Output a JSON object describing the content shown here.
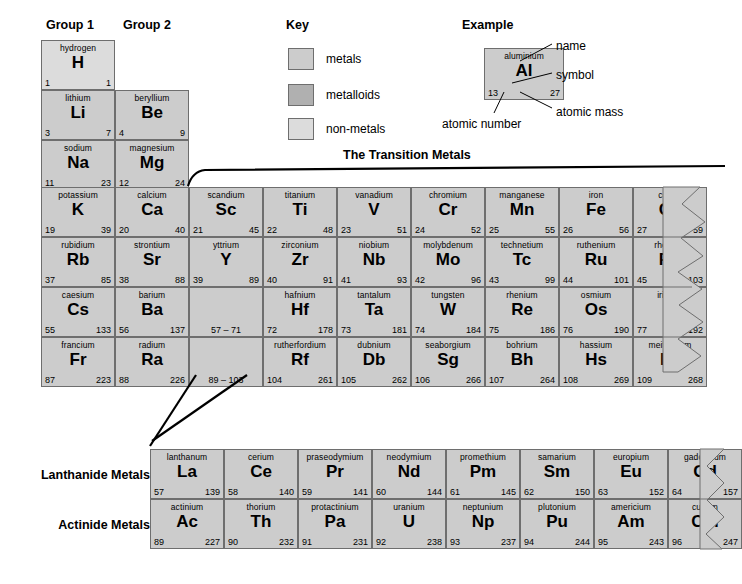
{
  "headers": {
    "group1": "Group 1",
    "group2": "Group 2",
    "key_title": "Key",
    "example_title": "Example",
    "transition_title": "The Transition Metals",
    "lanthanide_label": "Lanthanide Metals",
    "actinide_label": "Actinide Metals"
  },
  "key": {
    "items": [
      {
        "label": "metals",
        "class": "sw-metals",
        "color": "#cccccc"
      },
      {
        "label": "metalloids",
        "class": "sw-metalloids",
        "color": "#b0b0b0"
      },
      {
        "label": "non-metals",
        "class": "sw-nonmetals",
        "color": "#dcdcdc"
      }
    ]
  },
  "example": {
    "name": "aluminium",
    "symbol": "Al",
    "number": "13",
    "mass": "27",
    "callouts": {
      "name": "name",
      "symbol": "symbol",
      "atomic_mass": "atomic mass",
      "atomic_number": "atomic number"
    }
  },
  "main_table": {
    "rows": [
      [
        {
          "name": "hydrogen",
          "symbol": "H",
          "number": "1",
          "mass": "1",
          "type": "nonmetal"
        }
      ],
      [
        {
          "name": "lithium",
          "symbol": "Li",
          "number": "3",
          "mass": "7",
          "type": "metal"
        },
        {
          "name": "beryllium",
          "symbol": "Be",
          "number": "4",
          "mass": "9",
          "type": "metal"
        }
      ],
      [
        {
          "name": "sodium",
          "symbol": "Na",
          "number": "11",
          "mass": "23",
          "type": "metal"
        },
        {
          "name": "magnesium",
          "symbol": "Mg",
          "number": "12",
          "mass": "24",
          "type": "metal"
        }
      ],
      [
        {
          "name": "potassium",
          "symbol": "K",
          "number": "19",
          "mass": "39",
          "type": "metal"
        },
        {
          "name": "calcium",
          "symbol": "Ca",
          "number": "20",
          "mass": "40",
          "type": "metal"
        },
        {
          "name": "scandium",
          "symbol": "Sc",
          "number": "21",
          "mass": "45",
          "type": "metal"
        },
        {
          "name": "titanium",
          "symbol": "Ti",
          "number": "22",
          "mass": "48",
          "type": "metal"
        },
        {
          "name": "vanadium",
          "symbol": "V",
          "number": "23",
          "mass": "51",
          "type": "metal"
        },
        {
          "name": "chromium",
          "symbol": "Cr",
          "number": "24",
          "mass": "52",
          "type": "metal"
        },
        {
          "name": "manganese",
          "symbol": "Mn",
          "number": "25",
          "mass": "55",
          "type": "metal"
        },
        {
          "name": "iron",
          "symbol": "Fe",
          "number": "26",
          "mass": "56",
          "type": "metal"
        },
        {
          "name": "cobalt",
          "symbol": "Co",
          "number": "27",
          "mass": "59",
          "type": "metal"
        }
      ],
      [
        {
          "name": "rubidium",
          "symbol": "Rb",
          "number": "37",
          "mass": "85",
          "type": "metal"
        },
        {
          "name": "strontium",
          "symbol": "Sr",
          "number": "38",
          "mass": "88",
          "type": "metal"
        },
        {
          "name": "yttrium",
          "symbol": "Y",
          "number": "39",
          "mass": "89",
          "type": "metal"
        },
        {
          "name": "zirconium",
          "symbol": "Zr",
          "number": "40",
          "mass": "91",
          "type": "metal"
        },
        {
          "name": "niobium",
          "symbol": "Nb",
          "number": "41",
          "mass": "93",
          "type": "metal"
        },
        {
          "name": "molybdenum",
          "symbol": "Mo",
          "number": "42",
          "mass": "96",
          "type": "metal"
        },
        {
          "name": "technetium",
          "symbol": "Tc",
          "number": "43",
          "mass": "99",
          "type": "metal"
        },
        {
          "name": "ruthenium",
          "symbol": "Ru",
          "number": "44",
          "mass": "101",
          "type": "metal"
        },
        {
          "name": "rhodium",
          "symbol": "Rh",
          "number": "45",
          "mass": "103",
          "type": "metal"
        }
      ],
      [
        {
          "name": "caesium",
          "symbol": "Cs",
          "number": "55",
          "mass": "133",
          "type": "metal"
        },
        {
          "name": "barium",
          "symbol": "Ba",
          "number": "56",
          "mass": "137",
          "type": "metal"
        },
        {
          "range": "57 – 71",
          "type": "metal"
        },
        {
          "name": "hafnium",
          "symbol": "Hf",
          "number": "72",
          "mass": "178",
          "type": "metal"
        },
        {
          "name": "tantalum",
          "symbol": "Ta",
          "number": "73",
          "mass": "181",
          "type": "metal"
        },
        {
          "name": "tungsten",
          "symbol": "W",
          "number": "74",
          "mass": "184",
          "type": "metal"
        },
        {
          "name": "rhenium",
          "symbol": "Re",
          "number": "75",
          "mass": "186",
          "type": "metal"
        },
        {
          "name": "osmium",
          "symbol": "Os",
          "number": "76",
          "mass": "190",
          "type": "metal"
        },
        {
          "name": "iridium",
          "symbol": "Ir",
          "number": "77",
          "mass": "192",
          "type": "metal"
        }
      ],
      [
        {
          "name": "francium",
          "symbol": "Fr",
          "number": "87",
          "mass": "223",
          "type": "metal"
        },
        {
          "name": "radium",
          "symbol": "Ra",
          "number": "88",
          "mass": "226",
          "type": "metal"
        },
        {
          "range": "89 – 103",
          "type": "metal"
        },
        {
          "name": "rutherfordium",
          "symbol": "Rf",
          "number": "104",
          "mass": "261",
          "type": "metal"
        },
        {
          "name": "dubnium",
          "symbol": "Db",
          "number": "105",
          "mass": "262",
          "type": "metal"
        },
        {
          "name": "seaborgium",
          "symbol": "Sg",
          "number": "106",
          "mass": "266",
          "type": "metal"
        },
        {
          "name": "bohrium",
          "symbol": "Bh",
          "number": "107",
          "mass": "264",
          "type": "metal"
        },
        {
          "name": "hassium",
          "symbol": "Hs",
          "number": "108",
          "mass": "269",
          "type": "metal"
        },
        {
          "name": "meitnerium",
          "symbol": "Mt",
          "number": "109",
          "mass": "268",
          "type": "metal"
        }
      ]
    ]
  },
  "lanthanides": [
    {
      "name": "lanthanum",
      "symbol": "La",
      "number": "57",
      "mass": "139",
      "type": "metal"
    },
    {
      "name": "cerium",
      "symbol": "Ce",
      "number": "58",
      "mass": "140",
      "type": "metal"
    },
    {
      "name": "praseodymium",
      "symbol": "Pr",
      "number": "59",
      "mass": "141",
      "type": "metal"
    },
    {
      "name": "neodymium",
      "symbol": "Nd",
      "number": "60",
      "mass": "144",
      "type": "metal"
    },
    {
      "name": "promethium",
      "symbol": "Pm",
      "number": "61",
      "mass": "145",
      "type": "metal"
    },
    {
      "name": "samarium",
      "symbol": "Sm",
      "number": "62",
      "mass": "150",
      "type": "metal"
    },
    {
      "name": "europium",
      "symbol": "Eu",
      "number": "63",
      "mass": "152",
      "type": "metal"
    },
    {
      "name": "gadolinium",
      "symbol": "Gd",
      "number": "64",
      "mass": "157",
      "type": "metal"
    }
  ],
  "actinides": [
    {
      "name": "actinium",
      "symbol": "Ac",
      "number": "89",
      "mass": "227",
      "type": "metal"
    },
    {
      "name": "thorium",
      "symbol": "Th",
      "number": "90",
      "mass": "232",
      "type": "metal"
    },
    {
      "name": "protactinium",
      "symbol": "Pa",
      "number": "91",
      "mass": "231",
      "type": "metal"
    },
    {
      "name": "uranium",
      "symbol": "U",
      "number": "92",
      "mass": "238",
      "type": "metal"
    },
    {
      "name": "neptunium",
      "symbol": "Np",
      "number": "93",
      "mass": "237",
      "type": "metal"
    },
    {
      "name": "plutonium",
      "symbol": "Pu",
      "number": "94",
      "mass": "244",
      "type": "metal"
    },
    {
      "name": "americium",
      "symbol": "Am",
      "number": "95",
      "mass": "243",
      "type": "metal"
    },
    {
      "name": "curium",
      "symbol": "Cm",
      "number": "96",
      "mass": "247",
      "type": "metal"
    }
  ]
}
